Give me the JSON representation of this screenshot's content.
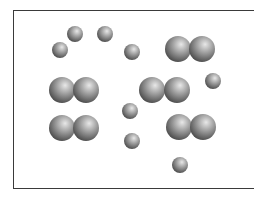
{
  "diagram": {
    "container": {
      "left": 13,
      "top": 10,
      "bottom": 190,
      "border_color": "#3a3a3a"
    },
    "colors": {
      "highlight": "#e8e8e8",
      "mid": "#9a9a9a",
      "shadow": "#3c3c3c"
    },
    "atoms": [
      {
        "id": "atom-1",
        "cx": 60,
        "cy": 50,
        "r": 8
      },
      {
        "id": "atom-2",
        "cx": 75,
        "cy": 34,
        "r": 8
      },
      {
        "id": "atom-3",
        "cx": 105,
        "cy": 34,
        "r": 8
      },
      {
        "id": "atom-4",
        "cx": 132,
        "cy": 52,
        "r": 8
      },
      {
        "id": "atom-5",
        "cx": 213,
        "cy": 81,
        "r": 8
      },
      {
        "id": "atom-6",
        "cx": 130,
        "cy": 111,
        "r": 8
      },
      {
        "id": "atom-7",
        "cx": 132,
        "cy": 141,
        "r": 8
      },
      {
        "id": "atom-8",
        "cx": 180,
        "cy": 165,
        "r": 8
      }
    ],
    "molecules": [
      {
        "id": "molecule-1",
        "atoms": [
          {
            "cx": 178,
            "cy": 49,
            "r": 13
          },
          {
            "cx": 202,
            "cy": 49,
            "r": 13
          }
        ]
      },
      {
        "id": "molecule-2",
        "atoms": [
          {
            "cx": 62,
            "cy": 90,
            "r": 13
          },
          {
            "cx": 86,
            "cy": 90,
            "r": 13
          }
        ]
      },
      {
        "id": "molecule-3",
        "atoms": [
          {
            "cx": 152,
            "cy": 90,
            "r": 13
          },
          {
            "cx": 177,
            "cy": 90,
            "r": 13
          }
        ]
      },
      {
        "id": "molecule-4",
        "atoms": [
          {
            "cx": 62,
            "cy": 128,
            "r": 13
          },
          {
            "cx": 86,
            "cy": 128,
            "r": 13
          }
        ]
      },
      {
        "id": "molecule-5",
        "atoms": [
          {
            "cx": 179,
            "cy": 127,
            "r": 13
          },
          {
            "cx": 203,
            "cy": 127,
            "r": 13
          }
        ]
      }
    ]
  }
}
